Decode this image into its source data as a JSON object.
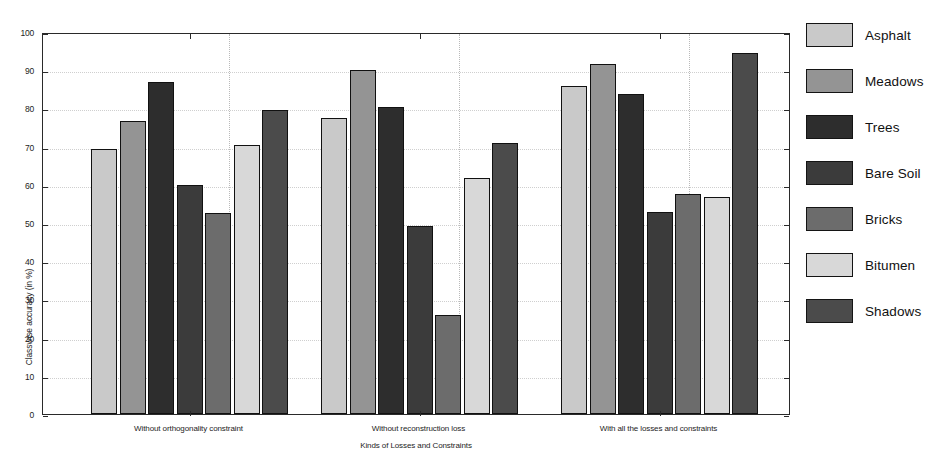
{
  "chart_data": {
    "type": "bar",
    "title": "",
    "xlabel": "Kinds of Losses and Constraints",
    "ylabel": "Classwise accuracy (in %)",
    "ylim": [
      0,
      100
    ],
    "yticks": [
      0,
      10,
      20,
      30,
      40,
      50,
      60,
      70,
      80,
      90,
      100
    ],
    "grid": true,
    "legend_position": "right",
    "categories": [
      "Without orthogonality constraint",
      "Without reconstruction loss",
      "With all the losses and constraints"
    ],
    "series": [
      {
        "name": "Asphalt",
        "color": "#c9c9c9",
        "values": [
          69.5,
          77.6,
          85.8
        ]
      },
      {
        "name": "Meadows",
        "color": "#949494",
        "values": [
          76.6,
          90.0,
          91.6
        ]
      },
      {
        "name": "Trees",
        "color": "#2d2d2d",
        "values": [
          86.9,
          80.4,
          83.7
        ]
      },
      {
        "name": "Bare Soil",
        "color": "#3b3b3b",
        "values": [
          60.0,
          49.2,
          52.8
        ]
      },
      {
        "name": "Bricks",
        "color": "#6c6c6c",
        "values": [
          52.5,
          26.0,
          57.6
        ]
      },
      {
        "name": "Bitumen",
        "color": "#d8d8d8",
        "values": [
          70.3,
          61.9,
          56.8
        ]
      },
      {
        "name": "Shadows",
        "color": "#4b4b4b",
        "values": [
          79.6,
          71.0,
          94.5
        ]
      }
    ]
  },
  "axes": {
    "y_title": "Classwise accuracy (in %)",
    "x_title": "Kinds of Losses and Constraints",
    "y_tick_labels": [
      "0",
      "10",
      "20",
      "30",
      "40",
      "50",
      "60",
      "70",
      "80",
      "90",
      "100"
    ],
    "x_tick_labels": [
      "Without orthogonality constraint",
      "Without reconstruction loss",
      "With all the losses and constraints"
    ]
  },
  "legend": {
    "items": [
      {
        "label": "Asphalt",
        "color": "#c9c9c9"
      },
      {
        "label": "Meadows",
        "color": "#949494"
      },
      {
        "label": "Trees",
        "color": "#2d2d2d"
      },
      {
        "label": "Bare Soil",
        "color": "#3b3b3b"
      },
      {
        "label": "Bricks",
        "color": "#6c6c6c"
      },
      {
        "label": "Bitumen",
        "color": "#d8d8d8"
      },
      {
        "label": "Shadows",
        "color": "#4b4b4b"
      }
    ]
  }
}
